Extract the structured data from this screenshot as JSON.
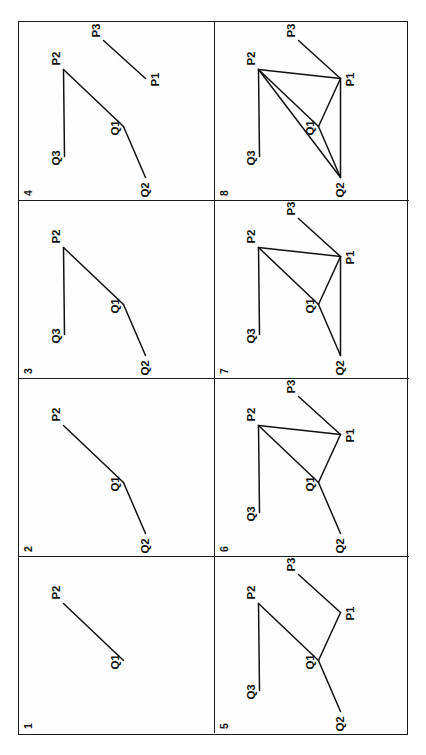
{
  "figure": {
    "type": "multi-panel-graph-diagram",
    "rotation_degrees": -90,
    "grid": {
      "columns": 2,
      "rows": 4
    },
    "stroke_color": "#111111",
    "background_color": "#ffffff",
    "frame_color": "#1a1a1a",
    "node_names": [
      "Q1",
      "Q2",
      "Q3",
      "P1",
      "P2",
      "P3"
    ],
    "node_positions": {
      "Q1": {
        "x": 74,
        "y": 104
      },
      "Q2": {
        "x": 23,
        "y": 126
      },
      "Q3": {
        "x": 44,
        "y": 45
      },
      "P1": {
        "x": 122,
        "y": 126
      },
      "P2": {
        "x": 131,
        "y": 44
      },
      "P3": {
        "x": 160,
        "y": 84
      }
    },
    "label_offsets": {
      "Q1": {
        "dx": -9,
        "dy": -14
      },
      "Q2": {
        "dx": -20,
        "dy": -6
      },
      "Q3": {
        "dx": -9,
        "dy": -14
      },
      "P1": {
        "dx": -8,
        "dy": 4
      },
      "P2": {
        "dx": 4,
        "dy": -13
      },
      "P3": {
        "dx": 3,
        "dy": -13
      }
    },
    "panels": [
      {
        "number": "1",
        "column": 0,
        "row": 3,
        "nodes": [
          "Q1",
          "P2"
        ],
        "edges": [
          [
            "Q1",
            "P2"
          ]
        ]
      },
      {
        "number": "2",
        "column": 0,
        "row": 2,
        "nodes": [
          "Q1",
          "Q2",
          "P2"
        ],
        "edges": [
          [
            "Q2",
            "Q1"
          ],
          [
            "Q1",
            "P2"
          ]
        ]
      },
      {
        "number": "3",
        "column": 0,
        "row": 1,
        "nodes": [
          "Q1",
          "Q2",
          "Q3",
          "P2"
        ],
        "edges": [
          [
            "Q2",
            "Q1"
          ],
          [
            "Q1",
            "P2"
          ],
          [
            "Q3",
            "P2"
          ]
        ]
      },
      {
        "number": "4",
        "column": 0,
        "row": 0,
        "nodes": [
          "Q1",
          "Q2",
          "Q3",
          "P1",
          "P2",
          "P3"
        ],
        "edges": [
          [
            "Q2",
            "Q1"
          ],
          [
            "Q1",
            "P2"
          ],
          [
            "Q3",
            "P2"
          ],
          [
            "P1",
            "P3"
          ]
        ]
      },
      {
        "number": "5",
        "column": 1,
        "row": 3,
        "nodes": [
          "Q1",
          "Q2",
          "Q3",
          "P1",
          "P2",
          "P3"
        ],
        "edges": [
          [
            "Q2",
            "Q1"
          ],
          [
            "Q1",
            "P2"
          ],
          [
            "Q3",
            "P2"
          ],
          [
            "Q1",
            "P1"
          ],
          [
            "P1",
            "P3"
          ]
        ]
      },
      {
        "number": "6",
        "column": 1,
        "row": 2,
        "nodes": [
          "Q1",
          "Q2",
          "Q3",
          "P1",
          "P2",
          "P3"
        ],
        "edges": [
          [
            "Q2",
            "Q1"
          ],
          [
            "Q1",
            "P2"
          ],
          [
            "Q3",
            "P2"
          ],
          [
            "Q1",
            "P1"
          ],
          [
            "P1",
            "P3"
          ],
          [
            "P1",
            "P2"
          ]
        ]
      },
      {
        "number": "7",
        "column": 1,
        "row": 1,
        "nodes": [
          "Q1",
          "Q2",
          "Q3",
          "P1",
          "P2",
          "P3"
        ],
        "edges": [
          [
            "Q2",
            "Q1"
          ],
          [
            "Q1",
            "P2"
          ],
          [
            "Q3",
            "P2"
          ],
          [
            "Q1",
            "P1"
          ],
          [
            "P1",
            "P3"
          ],
          [
            "P1",
            "P2"
          ],
          [
            "Q2",
            "P1"
          ]
        ]
      },
      {
        "number": "8",
        "column": 1,
        "row": 0,
        "nodes": [
          "Q1",
          "Q2",
          "Q3",
          "P1",
          "P2",
          "P3"
        ],
        "edges": [
          [
            "Q2",
            "Q1"
          ],
          [
            "Q1",
            "P2"
          ],
          [
            "Q3",
            "P2"
          ],
          [
            "Q1",
            "P1"
          ],
          [
            "P1",
            "P3"
          ],
          [
            "P1",
            "P2"
          ],
          [
            "Q2",
            "P1"
          ],
          [
            "Q2",
            "P2"
          ]
        ]
      }
    ]
  }
}
